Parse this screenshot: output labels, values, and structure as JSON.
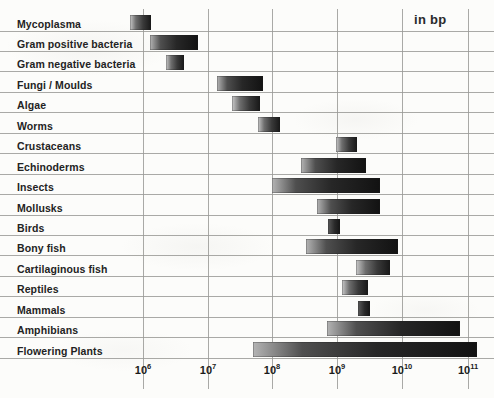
{
  "unit_label": "in bp",
  "axis": {
    "tick_mantissa": "10",
    "tick_exponents": [
      "6",
      "7",
      "8",
      "9",
      "10",
      "11"
    ]
  },
  "chart_data": {
    "type": "bar",
    "orientation": "horizontal",
    "title": "",
    "subtitle": "",
    "annotations": [
      "in bp"
    ],
    "xlabel": "Genome size (base pairs)",
    "ylabel": "",
    "xscale": "log",
    "xlim": [
      1000000,
      100000000000
    ],
    "xticks": [
      1000000,
      10000000,
      100000000,
      1000000000,
      10000000000,
      100000000000
    ],
    "xtick_labels": [
      "10^6",
      "10^7",
      "10^8",
      "10^9",
      "10^10",
      "10^11"
    ],
    "grid": true,
    "legend": "none",
    "value_kind": "range",
    "categories": [
      "Mycoplasma",
      "Gram positive bacteria",
      "Gram negative bacteria",
      "Fungi / Moulds",
      "Algae",
      "Worms",
      "Crustaceans",
      "Echinoderms",
      "Insects",
      "Mollusks",
      "Birds",
      "Bony fish",
      "Cartilaginous fish",
      "Reptiles",
      "Mammals",
      "Amphibians",
      "Flowering Plants"
    ],
    "ranges": [
      {
        "category": "Mycoplasma",
        "low": 600000,
        "high": 1300000
      },
      {
        "category": "Gram positive bacteria",
        "low": 1250000,
        "high": 7000000
      },
      {
        "category": "Gram negative bacteria",
        "low": 2200000,
        "high": 4700000
      },
      {
        "category": "Fungi / Moulds",
        "low": 12000000,
        "high": 110000000
      },
      {
        "category": "Algae",
        "low": 22000000,
        "high": 90000000
      },
      {
        "category": "Worms",
        "low": 80000000,
        "high": 200000000
      },
      {
        "category": "Crustaceans",
        "low": 1100000000,
        "high": 2100000000
      },
      {
        "category": "Echinoderms",
        "low": 450000000,
        "high": 2500000000
      },
      {
        "category": "Insects",
        "low": 110000000,
        "high": 5000000000
      },
      {
        "category": "Mollusks",
        "low": 750000000,
        "high": 5000000000
      },
      {
        "category": "Birds",
        "low": 900000000,
        "high": 1400000000
      },
      {
        "category": "Bony fish",
        "low": 330000000,
        "high": 9000000000
      },
      {
        "category": "Cartilaginous fish",
        "low": 1900000000,
        "high": 6500000000
      },
      {
        "category": "Reptiles",
        "low": 1300000000,
        "high": 3200000000
      },
      {
        "category": "Mammals",
        "low": 2000000000,
        "high": 2900000000
      },
      {
        "category": "Amphibians",
        "low": 900000000,
        "high": 60000000000
      },
      {
        "category": "Flowering Plants",
        "low": 67000000,
        "high": 90000000000
      }
    ]
  },
  "bar_geometry": [
    {
      "label": "Mycoplasma",
      "x": 130,
      "w": 21,
      "style": ""
    },
    {
      "label": "Gram positive bacteria",
      "x": 150,
      "w": 48,
      "style": "wide"
    },
    {
      "label": "Gram negative bacteria",
      "x": 166,
      "w": 18,
      "style": ""
    },
    {
      "label": "Fungi / Moulds",
      "x": 217,
      "w": 46,
      "style": "wide"
    },
    {
      "label": "Algae",
      "x": 232,
      "w": 28,
      "style": ""
    },
    {
      "label": "Worms",
      "x": 258,
      "w": 22,
      "style": ""
    },
    {
      "label": "Crustaceans",
      "x": 336,
      "w": 21,
      "style": ""
    },
    {
      "label": "Echinoderms",
      "x": 301,
      "w": 65,
      "style": "wide"
    },
    {
      "label": "Insects",
      "x": 272,
      "w": 108,
      "style": "wide"
    },
    {
      "label": "Mollusks",
      "x": 317,
      "w": 63,
      "style": "wide"
    },
    {
      "label": "Birds",
      "x": 328,
      "w": 12,
      "style": "tiny"
    },
    {
      "label": "Bony fish",
      "x": 306,
      "w": 92,
      "style": "wide"
    },
    {
      "label": "Cartilaginous fish",
      "x": 356,
      "w": 34,
      "style": ""
    },
    {
      "label": "Reptiles",
      "x": 342,
      "w": 26,
      "style": ""
    },
    {
      "label": "Mammals",
      "x": 358,
      "w": 12,
      "style": "tiny"
    },
    {
      "label": "Amphibians",
      "x": 327,
      "w": 133,
      "style": "wide"
    },
    {
      "label": "Flowering Plants",
      "x": 253,
      "w": 224,
      "style": "wide"
    }
  ]
}
